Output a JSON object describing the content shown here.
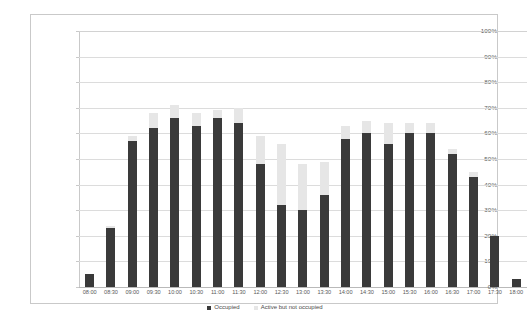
{
  "chart_data": {
    "type": "bar",
    "title": "",
    "xlabel": "",
    "ylabel": "",
    "stacked": true,
    "grid": true,
    "legend_position": "bottom",
    "ylim": [
      0,
      100
    ],
    "ytick_labels": [
      "100%",
      "90%",
      "80%",
      "70%",
      "60%",
      "50%",
      "40%",
      "30%",
      "20%",
      "10%",
      "0%"
    ],
    "ytick_values": [
      100,
      90,
      80,
      70,
      60,
      50,
      40,
      30,
      20,
      10,
      0
    ],
    "categories": [
      "08:00",
      "08:30",
      "09:00",
      "09:30",
      "10:00",
      "10:30",
      "11:00",
      "11:30",
      "12:00",
      "12:30",
      "13:00",
      "13:30",
      "14:00",
      "14:30",
      "15:00",
      "15:30",
      "16:00",
      "16:30",
      "17:00",
      "17:30",
      "18:00"
    ],
    "series": [
      {
        "name": "Occupied",
        "color": "#3a3a3a",
        "values": [
          5,
          23,
          57,
          62,
          66,
          63,
          66,
          64,
          48,
          32,
          30,
          36,
          58,
          60,
          56,
          60,
          60,
          52,
          43,
          20,
          3
        ]
      },
      {
        "name": "Active but not occupied",
        "color": "#e6e6e6",
        "values": [
          0,
          1,
          2,
          6,
          5,
          5,
          3,
          6,
          11,
          24,
          18,
          13,
          5,
          5,
          8,
          4,
          4,
          2,
          2,
          0,
          0
        ]
      }
    ],
    "totals": [
      5,
      24,
      59,
      68,
      71,
      68,
      69,
      70,
      59,
      56,
      48,
      49,
      63,
      65,
      64,
      64,
      64,
      54,
      45,
      20,
      3
    ]
  },
  "legend": {
    "items": [
      {
        "label": "Occupied",
        "marker": "square-marker",
        "color": "#3a3a3a"
      },
      {
        "label": "Active but not occupied",
        "marker": "square-marker",
        "color": "#e6e6e6"
      }
    ]
  },
  "colors": {
    "occupied": "#3a3a3a",
    "active_not_occupied": "#e6e6e6",
    "gridline": "#dcdcdc",
    "frame_border": "#c9c9c9",
    "background": "#ffffff"
  }
}
